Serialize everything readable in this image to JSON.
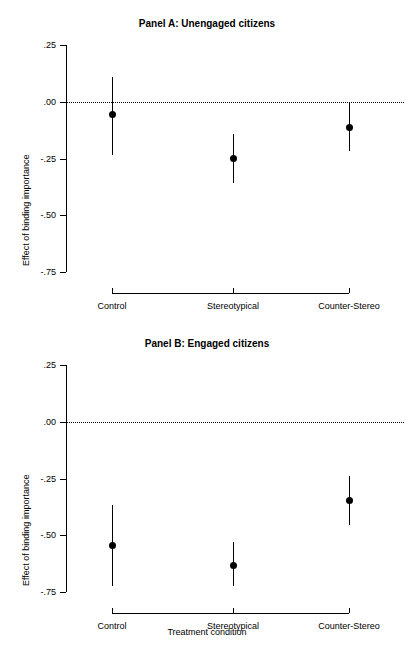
{
  "figure": {
    "xlabel": "Treatment condition"
  },
  "chart_data": [
    {
      "type": "scatter",
      "title": "Panel A: Unengaged citizens",
      "xlabel": "",
      "ylabel": "Effect of binding importance",
      "categories": [
        "Control",
        "Stereotypical",
        "Counter-Stereo"
      ],
      "ylim": [
        -0.75,
        0.25
      ],
      "yticks": [
        0.25,
        0.0,
        -0.25,
        -0.5,
        -0.75
      ],
      "ytick_labels": [
        ".25",
        ".00",
        "-.25",
        "-.50",
        "-.75"
      ],
      "grid": false,
      "legend": "none",
      "reference_line": 0.0,
      "reference_line_style": "dotted",
      "values": [
        -0.055,
        -0.25,
        -0.115
      ],
      "ci_low": [
        -0.235,
        -0.355,
        -0.215
      ],
      "ci_high": [
        0.11,
        -0.14,
        -0.005
      ],
      "points": [
        {
          "category": "Control",
          "estimate": -0.055,
          "ci_low": -0.235,
          "ci_high": 0.11
        },
        {
          "category": "Stereotypical",
          "estimate": -0.25,
          "ci_low": -0.355,
          "ci_high": -0.14
        },
        {
          "category": "Counter-Stereo",
          "estimate": -0.115,
          "ci_low": -0.215,
          "ci_high": -0.005
        }
      ]
    },
    {
      "type": "scatter",
      "title": "Panel B: Engaged citizens",
      "xlabel": "Treatment condition",
      "ylabel": "Effect of binding importance",
      "categories": [
        "Control",
        "Stereotypical",
        "Counter-Stereo"
      ],
      "ylim": [
        -0.75,
        0.25
      ],
      "yticks": [
        0.25,
        0.0,
        -0.25,
        -0.5,
        -0.75
      ],
      "ytick_labels": [
        ".25",
        ".00",
        "-.25",
        "-.50",
        "-.75"
      ],
      "grid": false,
      "legend": "none",
      "reference_line": 0.0,
      "reference_line_style": "dotted",
      "values": [
        -0.545,
        -0.635,
        -0.345
      ],
      "ci_low": [
        -0.72,
        -0.725,
        -0.455
      ],
      "ci_high": [
        -0.365,
        -0.53,
        -0.24
      ],
      "points": [
        {
          "category": "Control",
          "estimate": -0.545,
          "ci_low": -0.72,
          "ci_high": -0.365
        },
        {
          "category": "Stereotypical",
          "estimate": -0.635,
          "ci_low": -0.725,
          "ci_high": -0.53
        },
        {
          "category": "Counter-Stereo",
          "estimate": -0.345,
          "ci_low": -0.455,
          "ci_high": -0.24
        }
      ]
    }
  ]
}
